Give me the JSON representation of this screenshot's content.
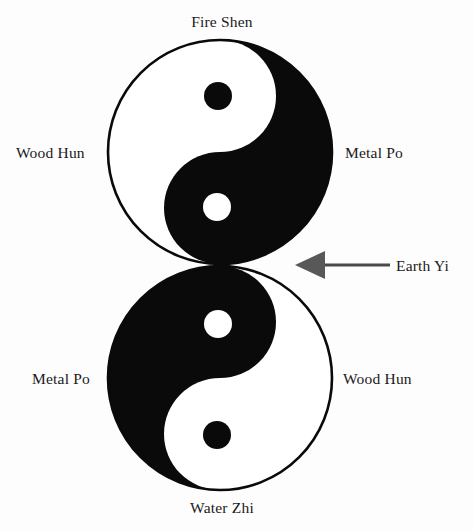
{
  "figure": {
    "background_color": "#fdfdfd",
    "ink_color": "#0a0a0a",
    "arrow_color": "#4a4a4a"
  },
  "labels": {
    "fire_shen": "Fire Shen",
    "wood_hun_top": "Wood Hun",
    "metal_po_top": "Metal Po",
    "earth_yi": "Earth Yi",
    "metal_po_bottom": "Metal Po",
    "wood_hun_bottom": "Wood Hun",
    "water_zhi": "Water Zhi"
  },
  "diagram": {
    "type": "taijitu-pair",
    "symbols": [
      {
        "name": "upper-taijitu",
        "center": {
          "x": 220,
          "y": 152
        },
        "radius": 112,
        "light_side": "left",
        "dark_side": "right",
        "dots": [
          {
            "name": "dark-dot",
            "x": 218,
            "y": 96,
            "r": 14,
            "color": "#0a0a0a"
          },
          {
            "name": "light-dot",
            "x": 217,
            "y": 207,
            "r": 14,
            "color": "#ffffff"
          }
        ],
        "positions": {
          "top": "Fire Shen",
          "left": "Wood Hun",
          "right": "Metal Po"
        }
      },
      {
        "name": "lower-taijitu",
        "center": {
          "x": 220,
          "y": 378
        },
        "radius": 112,
        "light_side": "right",
        "dark_side": "left",
        "dots": [
          {
            "name": "light-dot",
            "x": 218,
            "y": 324,
            "r": 14,
            "color": "#ffffff"
          },
          {
            "name": "dark-dot",
            "x": 217,
            "y": 435,
            "r": 14,
            "color": "#0a0a0a"
          }
        ],
        "positions": {
          "bottom": "Water Zhi",
          "left": "Metal Po",
          "right": "Wood Hun"
        }
      }
    ],
    "annotation": {
      "name": "earth-yi-pointer",
      "label": "Earth Yi",
      "points_to": "junction-between-circles",
      "arrow_direction": "left",
      "line": {
        "x1": 388,
        "y1": 265,
        "x2": 315,
        "y2": 265
      },
      "head": {
        "tip_x": 295,
        "tip_y": 265,
        "back_x": 322,
        "half_height": 14
      }
    }
  }
}
